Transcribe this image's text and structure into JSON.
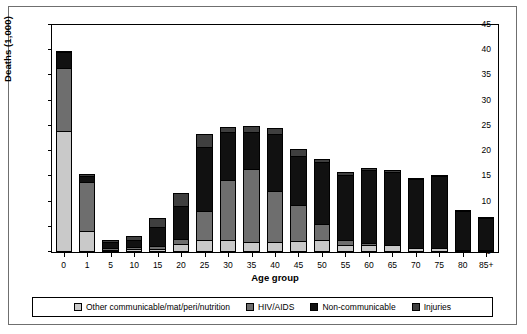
{
  "chart_data": {
    "type": "bar",
    "subtype": "stacked-bar",
    "title": "",
    "xlabel": "Age group",
    "ylabel": "Deaths (1,000)",
    "categories": [
      "0",
      "1",
      "5",
      "10",
      "15",
      "20",
      "25",
      "30",
      "35",
      "40",
      "45",
      "50",
      "55",
      "60",
      "65",
      "70",
      "75",
      "80",
      "85+"
    ],
    "ylim": [
      0,
      45
    ],
    "yticks": [
      0,
      5,
      10,
      15,
      20,
      25,
      30,
      35,
      40,
      45
    ],
    "grid": false,
    "legend_position": "bottom",
    "series": [
      {
        "name": "Other communicable/mat/peri/nutrition",
        "color": "#c9c9c9",
        "values": [
          24.0,
          4.2,
          0.4,
          0.5,
          0.6,
          1.6,
          2.4,
          2.3,
          2.0,
          1.9,
          2.2,
          2.3,
          1.4,
          1.4,
          1.3,
          0.8,
          0.8,
          0.4,
          0.4
        ]
      },
      {
        "name": "HIV/AIDS",
        "color": "#6e6e6e",
        "values": [
          12.4,
          9.7,
          0.3,
          0.5,
          0.5,
          1.0,
          5.7,
          11.9,
          14.4,
          10.1,
          7.2,
          3.3,
          1.0,
          0.3,
          0.1,
          0.0,
          0.0,
          0.0,
          0.0
        ]
      },
      {
        "name": "Non-communicable",
        "color": "#111111",
        "values": [
          3.2,
          1.2,
          1.2,
          1.4,
          3.8,
          6.6,
          12.8,
          9.6,
          7.4,
          11.3,
          9.7,
          12.3,
          12.9,
          14.5,
          14.4,
          13.6,
          14.3,
          7.7,
          6.4
        ]
      },
      {
        "name": "Injuries",
        "color": "#3f3f3f",
        "values": [
          0.2,
          0.3,
          0.5,
          0.8,
          1.9,
          2.5,
          2.5,
          1.0,
          1.2,
          1.3,
          1.3,
          0.6,
          0.6,
          0.5,
          0.4,
          0.3,
          0.2,
          0.1,
          0.1
        ]
      }
    ],
    "totals": [
      39.8,
      15.4,
      2.4,
      3.2,
      6.8,
      11.7,
      23.4,
      24.8,
      25.0,
      24.6,
      20.4,
      18.5,
      15.9,
      16.7,
      16.2,
      14.7,
      15.3,
      8.2,
      6.9
    ]
  },
  "legend": {
    "items": [
      {
        "label": "Other communicable/mat/peri/nutrition",
        "swatch": "#c9c9c9"
      },
      {
        "label": "HIV/AIDS",
        "swatch": "#6e6e6e"
      },
      {
        "label": "Non-communicable",
        "swatch": "#111111"
      },
      {
        "label": "Injuries",
        "swatch": "#3f3f3f"
      }
    ]
  }
}
